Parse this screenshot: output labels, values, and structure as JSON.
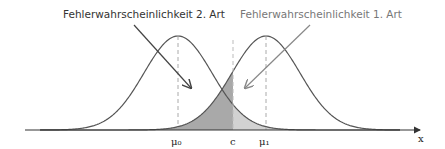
{
  "diagram": {
    "labels": {
      "type2_error": "Fehlerwahrscheinlichkeit 2. Art",
      "type1_error": "Fehlerwahrscheinlichkeit 1. Art"
    },
    "axis": {
      "x_label": "x",
      "ticks": [
        "μ₀",
        "c",
        "μ₁"
      ]
    },
    "colors": {
      "curve": "#555555",
      "type2_fill": "#a9a9a9",
      "type1_fill": "#d2d2d2",
      "overlap_fill": "#bdbdbd",
      "dashed": "#aaaaaa"
    }
  }
}
